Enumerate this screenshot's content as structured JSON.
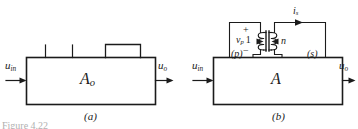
{
  "figure": {
    "background_color": "#ffffff",
    "ink_color": "#1b1b1b",
    "caption_partial": "Figure 4.22",
    "panels": [
      {
        "id": "a",
        "caption": "(a)",
        "block_label": "A",
        "block_label_sub": "o",
        "input_label": "u",
        "input_label_sub": "in",
        "output_label": "u",
        "output_label_sub": "o",
        "top_terminals": 2,
        "has_top_module": true
      },
      {
        "id": "b",
        "caption": "(b)",
        "block_label": "A",
        "block_label_sub": "",
        "input_label": "u",
        "input_label_sub": "in",
        "output_label": "u",
        "output_label_sub": "o",
        "transformer": {
          "primary_winding_label": "(p)",
          "secondary_winding_label": "(s)",
          "primary_voltage": "v",
          "primary_voltage_sub": "p",
          "primary_turns": "1",
          "secondary_turns": "n",
          "secondary_current": "i",
          "secondary_current_sub": "s",
          "polarity_plus": "+",
          "polarity_minus": "−"
        }
      }
    ]
  }
}
